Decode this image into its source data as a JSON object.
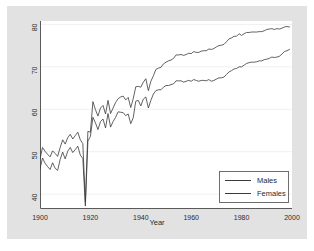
{
  "figure": {
    "background_color": "#e2e2e2",
    "plot_background_color": "#ffffff",
    "axis_color": "#5a5a5a",
    "grid_color": "#f0f0f0",
    "line_color": "#3a3a3a"
  },
  "axes": {
    "xlabel": "Year",
    "ylabel": "",
    "xticks": [
      "1900",
      "1920",
      "1940",
      "1960",
      "1980",
      "2000"
    ],
    "yticks": [
      "40",
      "50",
      "60",
      "70",
      "80"
    ]
  },
  "legend": {
    "entries": [
      {
        "label": "Males"
      },
      {
        "label": "Females"
      }
    ]
  },
  "chart_data": {
    "type": "line",
    "title": "",
    "xlabel": "Year",
    "ylabel": "",
    "xlim": [
      1900,
      2000
    ],
    "ylim": [
      36.5,
      80.8
    ],
    "xticks": [
      1900,
      1920,
      1940,
      1960,
      1980,
      2000
    ],
    "yticks": [
      40,
      50,
      60,
      70,
      80
    ],
    "grid": true,
    "legend_position": "lower-right",
    "x": [
      1900,
      1901,
      1902,
      1903,
      1904,
      1905,
      1906,
      1907,
      1908,
      1909,
      1910,
      1911,
      1912,
      1913,
      1914,
      1915,
      1916,
      1917,
      1918,
      1919,
      1920,
      1921,
      1922,
      1923,
      1924,
      1925,
      1926,
      1927,
      1928,
      1929,
      1930,
      1931,
      1932,
      1933,
      1934,
      1935,
      1936,
      1937,
      1938,
      1939,
      1940,
      1941,
      1942,
      1943,
      1944,
      1945,
      1946,
      1947,
      1948,
      1949,
      1950,
      1951,
      1952,
      1953,
      1954,
      1955,
      1956,
      1957,
      1958,
      1959,
      1960,
      1961,
      1962,
      1963,
      1964,
      1965,
      1966,
      1967,
      1968,
      1969,
      1970,
      1971,
      1972,
      1973,
      1974,
      1975,
      1976,
      1977,
      1978,
      1979,
      1980,
      1981,
      1982,
      1983,
      1984,
      1985,
      1986,
      1987,
      1988,
      1989,
      1990,
      1991,
      1992,
      1993,
      1994,
      1995,
      1996,
      1997,
      1998,
      1999
    ],
    "series": [
      {
        "name": "Males",
        "values": [
          46.0,
          48.5,
          47.3,
          46.5,
          45.8,
          47.4,
          46.1,
          45.6,
          48.2,
          49.9,
          48.3,
          50.1,
          51.0,
          49.8,
          50.5,
          51.3,
          49.2,
          48.4,
          37.2,
          52.5,
          53.6,
          58.1,
          56.8,
          55.2,
          57.1,
          57.7,
          55.6,
          59.0,
          55.8,
          57.1,
          58.1,
          59.4,
          59.3,
          59.2,
          58.5,
          58.9,
          56.6,
          58.0,
          61.9,
          62.1,
          60.8,
          62.4,
          62.9,
          60.3,
          62.1,
          63.6,
          64.4,
          64.6,
          64.6,
          65.2,
          65.6,
          65.6,
          65.8,
          66.0,
          66.7,
          66.7,
          66.7,
          66.4,
          66.6,
          66.8,
          66.6,
          67.0,
          66.8,
          66.6,
          66.8,
          66.8,
          66.7,
          67.0,
          66.6,
          66.8,
          67.1,
          67.4,
          67.4,
          67.6,
          68.2,
          68.8,
          69.1,
          69.5,
          69.6,
          70.0,
          70.0,
          70.4,
          70.8,
          71.0,
          71.1,
          71.1,
          71.2,
          71.4,
          71.4,
          71.7,
          71.8,
          72.0,
          72.3,
          72.2,
          72.3,
          72.5,
          73.0,
          73.6,
          73.8,
          74.1
        ]
      },
      {
        "name": "Females",
        "values": [
          48.3,
          51.0,
          50.1,
          49.4,
          48.8,
          50.2,
          49.6,
          48.9,
          51.0,
          52.8,
          51.8,
          53.3,
          54.1,
          53.0,
          53.8,
          54.6,
          52.8,
          51.9,
          38.1,
          54.8,
          54.6,
          61.8,
          59.9,
          58.4,
          60.3,
          60.9,
          58.9,
          62.1,
          59.0,
          60.3,
          61.6,
          62.5,
          62.9,
          63.1,
          62.2,
          62.8,
          60.4,
          62.5,
          65.3,
          65.4,
          65.2,
          66.4,
          67.2,
          64.4,
          66.6,
          67.9,
          69.4,
          69.7,
          69.9,
          70.7,
          71.1,
          71.4,
          71.6,
          72.0,
          72.8,
          72.8,
          72.9,
          72.7,
          72.9,
          73.2,
          73.1,
          73.6,
          73.4,
          73.4,
          73.7,
          73.8,
          73.8,
          74.2,
          74.1,
          74.3,
          74.7,
          75.0,
          75.1,
          75.3,
          75.9,
          76.6,
          76.8,
          77.2,
          77.2,
          77.8,
          77.4,
          77.8,
          78.1,
          78.1,
          78.2,
          78.2,
          78.2,
          78.3,
          78.3,
          78.5,
          78.8,
          78.9,
          79.0,
          78.8,
          79.0,
          78.9,
          79.1,
          79.4,
          79.5,
          79.4
        ]
      }
    ]
  }
}
